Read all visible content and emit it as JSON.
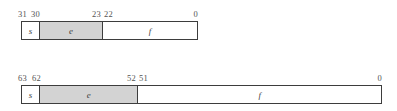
{
  "figure": {
    "background_color": "#ffffff",
    "box_border_color": "#3d3d3d",
    "shaded_fill_color": "#d3d3d3",
    "plain_fill_color": "#ffffff",
    "text_color": "#4a4a4a"
  },
  "diagrams": [
    {
      "name": "single-precision",
      "box": {
        "left": 21,
        "top": 21,
        "width": 177,
        "height": 19
      },
      "bit_labels": [
        {
          "text": "31",
          "x": 18,
          "align": "left"
        },
        {
          "text": "30",
          "x": 31,
          "align": "left"
        },
        {
          "text": "23",
          "x": 101,
          "align": "right"
        },
        {
          "text": "22",
          "x": 104,
          "align": "left"
        },
        {
          "text": "0",
          "x": 198,
          "align": "right"
        }
      ],
      "fields": [
        {
          "label": "s",
          "width": 17,
          "fill": "plain"
        },
        {
          "label": "e",
          "width": 64,
          "fill": "shaded"
        },
        {
          "label": "f",
          "width": 96,
          "fill": "plain"
        }
      ]
    },
    {
      "name": "double-precision",
      "box": {
        "left": 21,
        "top": 85,
        "width": 361,
        "height": 19
      },
      "bit_labels": [
        {
          "text": "63",
          "x": 18,
          "align": "left"
        },
        {
          "text": "62",
          "x": 32,
          "align": "left"
        },
        {
          "text": "52",
          "x": 136,
          "align": "right"
        },
        {
          "text": "51",
          "x": 139,
          "align": "left"
        },
        {
          "text": "0",
          "x": 382,
          "align": "right"
        }
      ],
      "fields": [
        {
          "label": "s",
          "width": 17,
          "fill": "plain"
        },
        {
          "label": "e",
          "width": 99,
          "fill": "shaded"
        },
        {
          "label": "f",
          "width": 245,
          "fill": "plain"
        }
      ]
    }
  ]
}
